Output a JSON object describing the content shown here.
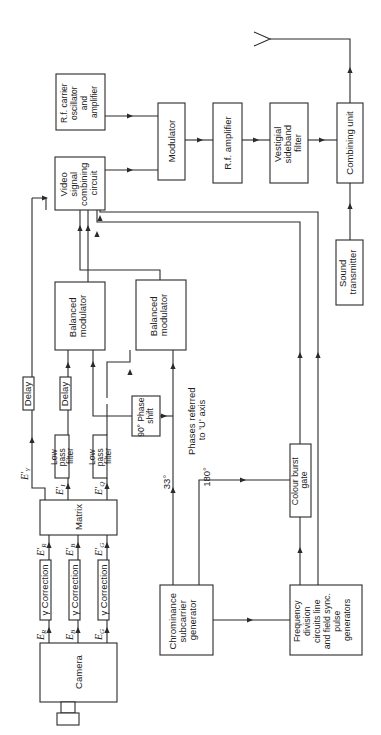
{
  "diagram": {
    "orientation": "rotated 90 degrees counter-clockwise",
    "blocks": {
      "camera": "Camera",
      "gamma_r": "γ Correction",
      "gamma_b": "γ Correction",
      "gamma_g": "γ Correction",
      "matrix": "Matrix",
      "lpf_i_1": "Low",
      "lpf_i_2": "pass",
      "lpf_i_3": "filter",
      "lpf_q_1": "Low",
      "lpf_q_2": "pass",
      "lpf_q_3": "filter",
      "delay_y": "Delay",
      "delay_i": "Delay",
      "balmod_i_1": "Balanced",
      "balmod_i_2": "modulator",
      "balmod_q_1": "Balanced",
      "balmod_q_2": "modulator",
      "phase_1": "90° Phase",
      "phase_2": "shift",
      "video_1": "Video",
      "video_2": "signal",
      "video_3": "combining",
      "video_4": "circuit",
      "rfosc_1": "R.f. carrier",
      "rfosc_2": "oscillator",
      "rfosc_3": "and",
      "rfosc_4": "amplifier",
      "modulator": "Modulator",
      "rfamp": "R.f. amplifier",
      "vsb_1": "Vestigial",
      "vsb_2": "sideband",
      "vsb_3": "filter",
      "combining": "Combining unit",
      "sound_1": "Sound",
      "sound_2": "transmitter",
      "chroma_1": "Chrominance",
      "chroma_2": "subcarrier",
      "chroma_3": "generator",
      "freq_1": "Frequency",
      "freq_2": "division",
      "freq_3": "circuits line",
      "freq_4": "and field sync.",
      "freq_5": "pulse",
      "freq_6": "generators",
      "burst_1": "Colour burst",
      "burst_2": "gate"
    },
    "signals": {
      "er": "E",
      "er_sub": "R",
      "eb": "E",
      "eb_sub": "B",
      "eg": "E",
      "eg_sub": "G",
      "epr": "E'",
      "epr_sub": "R",
      "epb": "E'",
      "epb_sub": "B",
      "epg": "E'",
      "epg_sub": "G",
      "epy": "E'",
      "epy_sub": "Y",
      "epi": "E'",
      "epi_sub": "I",
      "epq": "E'",
      "epq_sub": "Q"
    },
    "annotations": {
      "phase_33": "33°",
      "phase_180": "180°",
      "phases_ref_1": "Phases referred",
      "phases_ref_2": "to  'U' axis"
    }
  }
}
